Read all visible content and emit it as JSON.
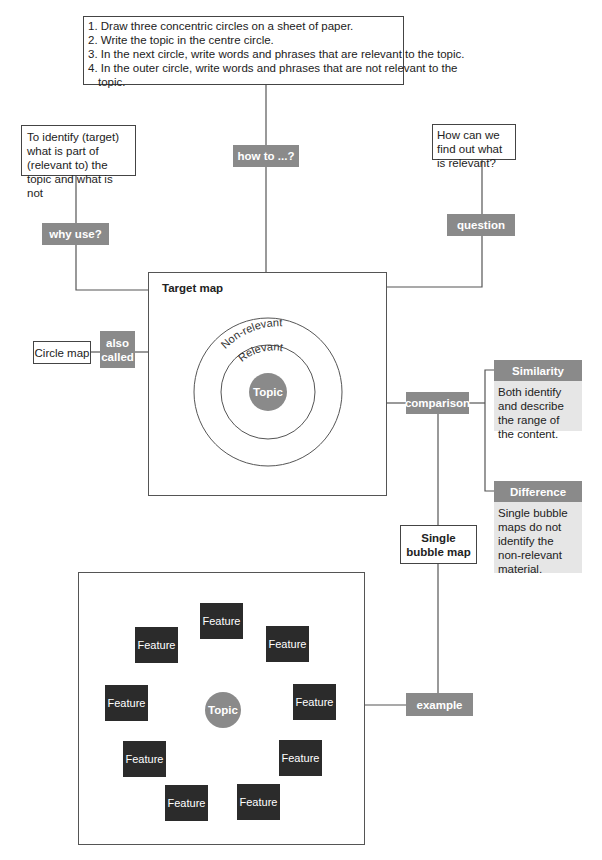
{
  "steps_box": {
    "lines": [
      "1. Draw three concentric circles on a sheet of paper.",
      "2. Write the topic in the centre circle.",
      "3. In the next circle, write words and phrases that are relevant to the topic.",
      "4. In the outer circle, write words and phrases that are not relevant to the",
      "topic."
    ]
  },
  "labels": {
    "how_to": "how to ...?",
    "why_use": "why use?",
    "question": "question",
    "also_called": "also called",
    "comparison": "comparison",
    "example": "example"
  },
  "why_box": {
    "text": "To identify (target) what is part of (relevant to) the topic and what is not"
  },
  "question_box": {
    "text": "How can we find out what is relevant?"
  },
  "target_map": {
    "title": "Target map",
    "outer_ring": "Non-relevant",
    "inner_ring": "Relevant",
    "center": "Topic"
  },
  "circle_map": {
    "text": "Circle map"
  },
  "similarity": {
    "heading": "Similarity",
    "text": "Both identify and describe the range of the content."
  },
  "difference": {
    "heading": "Difference",
    "text": "Single bubble maps do not identify the non-relevant material."
  },
  "single_bubble_map": {
    "text": "Single bubble map"
  },
  "bubble_example": {
    "center": "Topic",
    "features": [
      "Feature",
      "Feature",
      "Feature",
      "Feature",
      "Feature",
      "Feature",
      "Feature",
      "Feature",
      "Feature"
    ]
  },
  "colors": {
    "label_bg": "#8a8a8a",
    "feature_bg": "#2b2b2b",
    "panel_bg": "#e6e6e6",
    "line": "#555555"
  }
}
